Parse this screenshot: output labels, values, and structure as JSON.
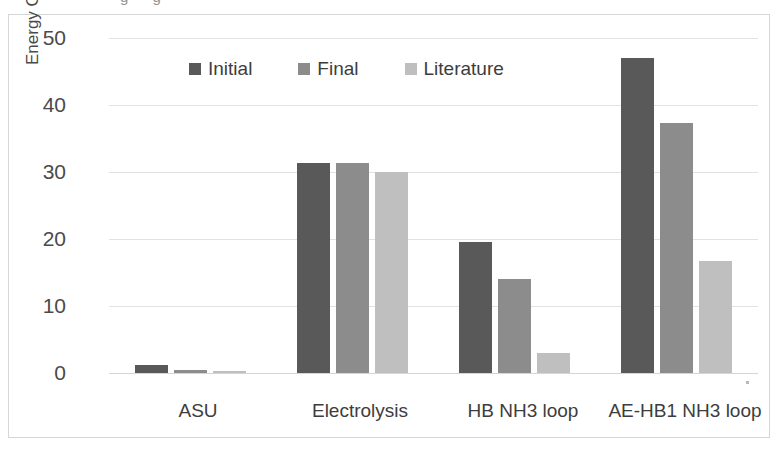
{
  "figure": {
    "clipped_text_above": "g g",
    "frame_color": "#d6d6d6",
    "background": "#ffffff"
  },
  "chart_data": {
    "type": "bar",
    "title": "",
    "subtitle": "",
    "xlabel": "",
    "ylabel": "Energy Consumption (GJ/tNH3)",
    "ylabel_base": "Energy Consumption (GJ/tNH",
    "ylabel_sub": "3",
    "ylabel_close": ")",
    "categories": [
      "ASU",
      "Electrolysis",
      "HB NH3 loop",
      "AE-HB1 NH3 loop"
    ],
    "series": [
      {
        "name": "Initial",
        "color": "#595959",
        "values": [
          1.2,
          31.3,
          19.5,
          47.0
        ]
      },
      {
        "name": "Final",
        "color": "#8c8c8c",
        "values": [
          0.5,
          31.3,
          14.0,
          37.3
        ]
      },
      {
        "name": "Literature",
        "color": "#bfbfbf",
        "values": [
          0.3,
          30.0,
          3.0,
          16.7
        ]
      }
    ],
    "ylim": [
      0,
      50
    ],
    "yticks": [
      0,
      10,
      20,
      30,
      40,
      50
    ],
    "ytick_labels": [
      "0",
      "10",
      "20",
      "30",
      "40",
      "50"
    ],
    "grid": true,
    "grid_axis": "y",
    "legend": true,
    "legend_position": "top-center-inside",
    "bar_group_count": 4,
    "bars_per_group": 3
  }
}
